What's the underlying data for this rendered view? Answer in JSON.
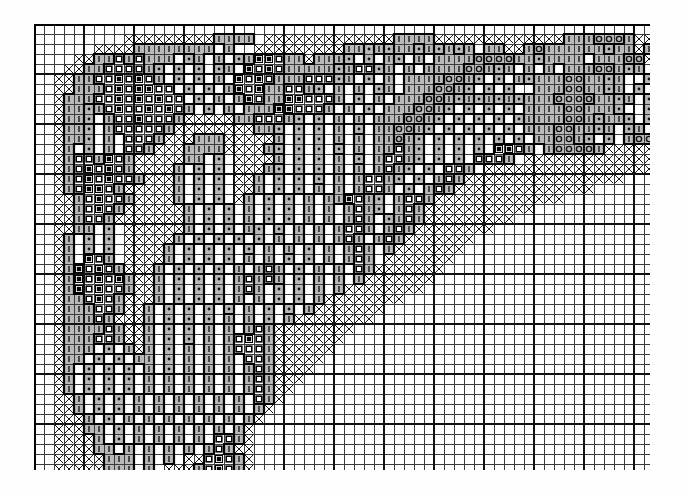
{
  "document": {
    "kind": "cross-stitch-pattern-chart",
    "title": "",
    "background_color": "#ffffff"
  },
  "grid": {
    "origin_x": 34,
    "origin_y": 24,
    "cell_size": 10,
    "columns": 62,
    "rows": 45,
    "thin_line_color": "#3c3c3c",
    "thin_line_width": 1,
    "bold_line_color": "#111111",
    "bold_line_width": 2,
    "bold_every": 5,
    "border_color": "#000000",
    "border_width": 2
  },
  "legend": {
    "symbols": [
      {
        "key": "blank",
        "glyph": "",
        "name": "empty-cell",
        "fill": "#ffffff",
        "ink": "#000000"
      },
      {
        "key": "cross",
        "glyph": "X",
        "name": "cross-symbol",
        "fill": "#ffffff",
        "ink": "#1a1a1a"
      },
      {
        "key": "bar",
        "glyph": "|",
        "name": "vertical-bar-symbol",
        "fill": "#b9b9b9",
        "ink": "#2a2a2a"
      },
      {
        "key": "dot",
        "glyph": "·",
        "name": "dot-symbol",
        "fill": "#b9b9b9",
        "ink": "#111111"
      },
      {
        "key": "ring",
        "glyph": "O",
        "name": "open-circle-symbol",
        "fill": "#b9b9b9",
        "ink": "#111111"
      },
      {
        "key": "open",
        "glyph": "□",
        "name": "open-square-symbol",
        "fill": "#ffffff",
        "ink": "#000000"
      },
      {
        "key": "solid",
        "glyph": "■",
        "name": "filled-square-symbol",
        "fill": "#ffffff",
        "ink": "#000000"
      },
      {
        "key": "shade",
        "glyph": "",
        "name": "shaded-cell",
        "fill": "#b9b9b9",
        "ink": "#000000"
      }
    ],
    "outline": {
      "name": "colour-block-outline",
      "color": "#000000",
      "width": 2.2
    }
  },
  "chart_data": {
    "type": "heatmap",
    "xlabel": "stitch column",
    "ylabel": "stitch row",
    "grid": true,
    "legend_position": "none",
    "columns": 62,
    "rows": 45,
    "symbol_codes": [
      ".",
      "X",
      "|",
      "d",
      "o",
      "q",
      "s"
    ],
    "symbol_meaning": {
      ".": "blank / unstitched",
      "X": "cross on white",
      "|": "vertical bar on grey",
      "d": "dot on grey",
      "o": "open circle on grey",
      "q": "open square on white",
      "s": "filled square on white"
    },
    "cells": [
      "..............................................................",
      ".........XXXXXXXXX||||.XXXXXXXXXXXXX||||XXXXXXXXXXXXX|||ooo|XXX",
      "......XXXX||||||||.|..XXXXXXXXX||d|d||d|d|d|.||XX|o||||||d||X|o",
      "....XX||q|q|||.d|.|.d|ssq||X|||d.d.|d.|.||||oooo||d||||.|||ooX.",
      "...XX||qqqq|d.d.d.d|.sqsq|||||d|qqd|.|.||||oo|d|.|.|.|||oo|d|.d",
      "..XX||qqsqsq|.d.d.|.sqsq|||qqqd|.d.|.||||oo|d.d.|d|||oo||d|..d.",
      "..XX|||qsqssqq.d.d.|sqs||qq|d.|.|.d|.|||oo|d.d.d..|||oo||d|.d..",
      "..X|||qqsqsqsqq.d.|.|sq||ssqqq|.d.|.|||oo|d|d|d|d|||oooo||d|.d.",
      "..X||d|qsqqsqsq|.d.|.|||ssqqq|.|.d.|||oo|d.d.d.d.||||oo|||d..d.",
      "..X||d.|qqsqqq|XXXXX||qqq|d.d.|.|.|||oo|d.d.d.d.d||||oo|d||d.d.",
      "..X||d.|qqqqq|XXXXXXXX||d.d.d.|.d.||oo|d.d.d.d.d.|||oo||d|.d|..",
      "..X||d.|.qqq|XXX|||XXXXX|.d.d.|.|.||o|d.d.d.d.d.d.||oo|d.d.|ooo",
      "..X|.d.|.qq|XXX||||XXXX|d.d.d.d.|.||q|d.d.d.d.ssq|.|oooo|XXXXXX",
      "..X|qq|sq|XXXXX||.d.XXXX|.d.d.|.d.|qq|d.d.d.qqq|.XXXXXXXXXXXXXX",
      "..X|qsqsq|XXXX|.d.d.XXX|d.d.d.|.|.|q|d.d.qq|.XXXXXXXXXXXXXXXXX.",
      "..X|qsqsqq|XXX|.d.d.XX|.d.d.d.|.|qq|d.d.|q|XXXXXXXXXXXXXXXX....",
      "..X|qssq|XXXXX|.d.d.XX|.d.d.|.|.|qq|.d.|q|XXXXXXXXXXXXXX.......",
      "..XX|qsqq|XXXX|.d.d.X|.d.d.|.||sq|d.|qq|XXXXXXXXXXXXX..........",
      "..XX|qsq|XXXXXX|.d.d.|.d.d.|.|.|q|d.|q|XXXXXXXXXXX.............",
      "..XX|qq|XXXXXXX|.d.d.|.d.d.|.|.|q|.d|q|XXXXXXXXX...............",
      "..XX||.d.XXXXXX|.d.d.|d.d.|.|.|qq|.|q|XXXXXXXX.................",
      "..X|.d.d.XXXXX|.d.d.d.d.|.|.|.|q|.|q|XXXXXXX...................",
      "..X|.d.d.XXXX|.d.d.d.d.|.|.d.|.|q|.|XXXXXXX....................",
      "..X|.sq|.XXXX|.d.d.d.|.|.d.d.|.|q|.XXXXXXX.....................",
      "..X|sqsq|XXX|.d.d.d.|.|q|.d.|.|.q|XXXXXXX......................",
      "..X|sqsqs|XX|.d.d.d.|q|q|.d.|.|.|XXXXXXX.......................",
      "..X|sqsqq|XX|.d.d.d.|q|.d.d.|.|XXXXXXXX........................",
      "..X||qsq|XXX|.d.d.d.|.|.d.d.|XXXXXXXX..........................",
      "..X|||qq|XX|.d.d.d.d.|.d.d.|XXXXXXX............................",
      "..X|||q|XXX|.d.d.d.|.|.d.|XXXXXXXX.............................",
      "..X||||q|XX|.d.d.|.|.|q|XXXXXXXX...............................",
      "..X|||qq|XX|.d.d.|.|qsq|XXXXXXX................................",
      "..X|||.d.|X|.d.|.|.|qqq|XXXXXX.................................",
      "..X||.d.d.||.d.|.|.|.qq|XXXXX..................................",
      "..X|.d.d.d.|.d.|.|.|.|q|XXXX...................................",
      "..X|.d.d.d.|.|.|.|.|.|q|XXX....................................",
      "..X|.d.d.d.|.|.|.|.|.|q|XX.....................................",
      "..XX|.d.d.|.|.|.|.|.|.q|X......................................",
      "..XX|.d.d.|.|.|.|.|.|.|X.......................................",
      "..XXX|.d.|.|.|.|.|.|.|X.......................................",
      "..XXX||.d.|.|.|.|.|.|X........................................",
      "..XXXX|.d.|.|.|.|.qq|X........................................",
      "..XXXX||.|.|.|.|.|q|XX........................................",
      "..XXXXX|||.|.|.XXqsq|X........................................",
      "..XXXXX|||.|.XXX|qsq|X........................................"
    ]
  }
}
